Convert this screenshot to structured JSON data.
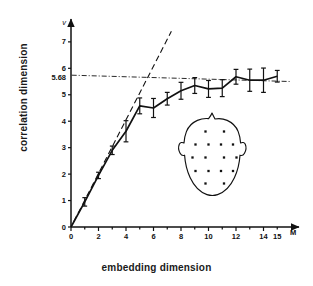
{
  "figure": {
    "axis_symbol": "v",
    "xaxis_symbol": "M",
    "saturation_label": "5.68"
  },
  "labels": {
    "ylabel": "correlation dimension",
    "xlabel": "embedding dimension"
  },
  "inset": {
    "name": "eeg-electrode-montage",
    "electrode_count": 16
  },
  "chart_data": {
    "type": "line",
    "title": "",
    "xlabel": "embedding dimension",
    "ylabel": "correlation dimension",
    "xlim": [
      0,
      16
    ],
    "ylim": [
      0,
      7.6
    ],
    "grid": false,
    "legend": null,
    "xticks": [
      0,
      2,
      4,
      6,
      8,
      10,
      12,
      14,
      15
    ],
    "xticklabels": [
      "0",
      "2",
      "4",
      "6",
      "8",
      "10",
      "12",
      "14",
      "15"
    ],
    "yticks": [
      0,
      1,
      2,
      3,
      4,
      5,
      6,
      7
    ],
    "yticklabels": [
      "0",
      "1",
      "2",
      "3",
      "4",
      "5",
      "6",
      "7"
    ],
    "annotations": [
      {
        "text": "5.68",
        "type": "y-axis-value",
        "y": 5.68
      },
      {
        "text": "v",
        "type": "y-axis-symbol"
      },
      {
        "text": "M",
        "type": "x-axis-symbol"
      }
    ],
    "series": [
      {
        "name": "correlation dimension vs embedding dimension",
        "style": "solid-line-with-error-bars",
        "x": [
          1,
          2,
          3,
          4,
          5,
          6,
          7,
          8,
          9,
          10,
          11,
          12,
          13,
          14,
          15
        ],
        "values": [
          0.95,
          1.95,
          2.9,
          3.62,
          4.58,
          4.5,
          4.85,
          5.15,
          5.35,
          5.22,
          5.25,
          5.68,
          5.55,
          5.55,
          5.7
        ],
        "yerr": [
          0.16,
          0.12,
          0.16,
          0.4,
          0.3,
          0.36,
          0.24,
          0.32,
          0.3,
          0.32,
          0.32,
          0.28,
          0.42,
          0.46,
          0.22
        ]
      },
      {
        "name": "slope-one reference line",
        "style": "dashed",
        "x": [
          0.2,
          7.3
        ],
        "values": [
          0.2,
          7.4
        ]
      },
      {
        "name": "saturation level",
        "style": "dash-dot-horizontal",
        "y": 5.68,
        "x": [
          0.05,
          16.0
        ],
        "values": [
          5.74,
          5.5
        ]
      }
    ]
  }
}
